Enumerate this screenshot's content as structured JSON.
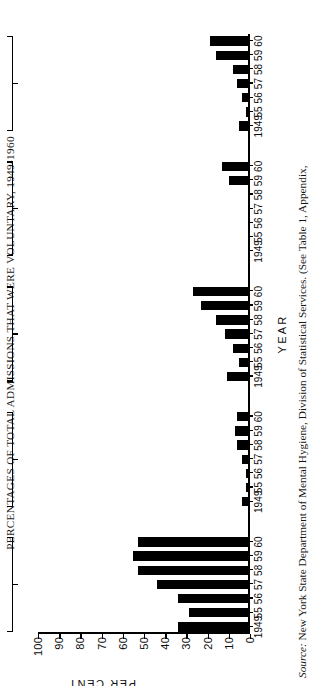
{
  "figure": {
    "title": "PERCENTAGES OF TOTAL ADMISSIONS THAT WERE VOLUNTARY, 1949-1960",
    "source_label": "Source:",
    "source_text": " New York State Department of Mental Hygiene, Division of Statistical Services. (See Table 1, Appendix,"
  },
  "axes": {
    "y_caption": "PER CENT",
    "x_caption": "YEAR"
  },
  "chart_data": {
    "type": "bar",
    "title": "PERCENTAGES OF TOTAL ADMISSIONS THAT WERE VOLUNTARY, 1949-1960",
    "xlabel": "YEAR",
    "ylabel": "PER CENT",
    "ylim": [
      0,
      100
    ],
    "yticks": [
      0,
      10,
      20,
      30,
      40,
      50,
      60,
      70,
      80,
      90,
      100
    ],
    "ytick_labels": [
      "0",
      "10",
      "20",
      "30",
      "40",
      "50",
      "60",
      "70",
      "80",
      "90",
      "100"
    ],
    "grid": false,
    "legend": "none",
    "orientation": "vertical",
    "categories": [
      "1949",
      "55",
      "56",
      "57",
      "58",
      "59",
      "60"
    ],
    "groups": [
      {
        "name": "ST. LAWRENCE\nSTATE HOSPITAL",
        "name_lines": [
          "ST. LAWRENCE",
          "STATE HOSPITAL"
        ],
        "values": [
          34,
          29,
          34,
          44,
          53,
          55,
          53
        ]
      },
      {
        "name": "HARLEM VALLEY\nSTATE HOSPITAL *",
        "name_lines": [
          "HARLEM VALLEY",
          "STATE HOSPITAL *"
        ],
        "values": [
          4,
          2,
          2,
          4,
          6,
          7,
          6
        ]
      },
      {
        "name": "HOSPITALS SERVING\nUPSTATE AREA",
        "name_lines": [
          "HOSPITALS SERVING",
          "UPSTATE AREA"
        ],
        "values": [
          11,
          5,
          8,
          12,
          16,
          23,
          27
        ]
      },
      {
        "name": "HOSPITALS SERVING\nNEW YORK CITY\nAREA",
        "name_lines": [
          "HOSPITALS SERVING",
          "NEW YORK CITY",
          "AREA"
        ],
        "values": [
          0,
          0,
          0,
          0,
          0,
          10,
          13
        ]
      },
      {
        "name": "ALL HOSPITALS †",
        "name_lines": [
          "ALL HOSPITALS †"
        ],
        "values": [
          5,
          2,
          4,
          6,
          8,
          16,
          19
        ]
      }
    ],
    "group_tick_labels": [
      "1949",
      "55",
      "56",
      "57",
      "58",
      "59",
      "60"
    ]
  }
}
